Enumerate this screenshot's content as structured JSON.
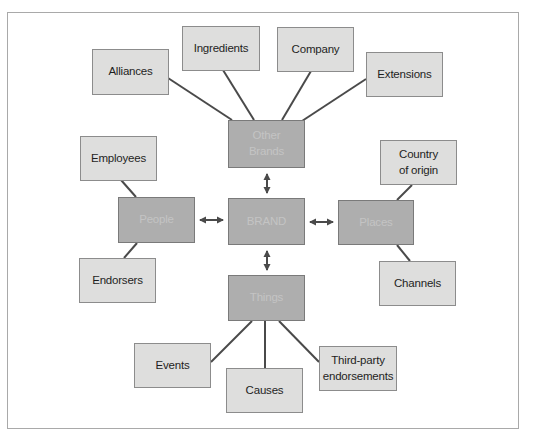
{
  "diagram": {
    "type": "brand-associations-network",
    "center": {
      "id": "brand",
      "label": "BRAND"
    },
    "hubs": [
      {
        "id": "other_brands",
        "label": "Other\nBrands"
      },
      {
        "id": "people",
        "label": "People"
      },
      {
        "id": "places",
        "label": "Places"
      },
      {
        "id": "things",
        "label": "Things"
      }
    ],
    "leaves": {
      "alliances": "Alliances",
      "ingredients": "Ingredients",
      "company": "Company",
      "extensions": "Extensions",
      "employees": "Employees",
      "endorsers": "Endorsers",
      "country_of_origin": "Country\nof origin",
      "channels": "Channels",
      "events": "Events",
      "causes": "Causes",
      "third_party": "Third-party\nendorsements"
    },
    "edges": [
      {
        "from": "brand",
        "to": "other_brands",
        "style": "double-arrow"
      },
      {
        "from": "brand",
        "to": "people",
        "style": "double-arrow"
      },
      {
        "from": "brand",
        "to": "places",
        "style": "double-arrow"
      },
      {
        "from": "brand",
        "to": "things",
        "style": "double-arrow"
      },
      {
        "from": "other_brands",
        "to": "alliances",
        "style": "line"
      },
      {
        "from": "other_brands",
        "to": "ingredients",
        "style": "line"
      },
      {
        "from": "other_brands",
        "to": "company",
        "style": "line"
      },
      {
        "from": "other_brands",
        "to": "extensions",
        "style": "line"
      },
      {
        "from": "people",
        "to": "employees",
        "style": "line"
      },
      {
        "from": "people",
        "to": "endorsers",
        "style": "line"
      },
      {
        "from": "places",
        "to": "country_of_origin",
        "style": "line"
      },
      {
        "from": "places",
        "to": "channels",
        "style": "line"
      },
      {
        "from": "things",
        "to": "events",
        "style": "line"
      },
      {
        "from": "things",
        "to": "causes",
        "style": "line"
      },
      {
        "from": "things",
        "to": "third_party",
        "style": "line"
      }
    ],
    "colors": {
      "hub_fill": "#aeaeae",
      "leaf_fill": "#dededd",
      "line": "#4a4a4a",
      "frame": "#a9a9a9"
    }
  }
}
